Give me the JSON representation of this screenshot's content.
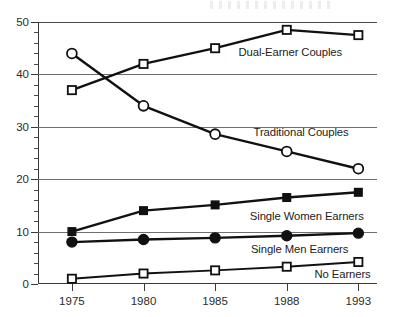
{
  "chart_data": {
    "type": "line",
    "title": "",
    "subtitle": "",
    "xlabel": "",
    "ylabel": "",
    "categories": [
      "1975",
      "1980",
      "1985",
      "1988",
      "1993"
    ],
    "ylim": [
      0,
      50
    ],
    "yticks_major": [
      0,
      10,
      20,
      30,
      40,
      50
    ],
    "ytick_labels": [
      "0",
      "10",
      "20",
      "30",
      "40",
      "50"
    ],
    "ytick_minor_step": 2,
    "grid": "horizontal-major",
    "legend_position": "inline-annotations",
    "series": [
      {
        "name": "Dual-Earner Couples",
        "marker": "open-square",
        "values": [
          37,
          42,
          45,
          48.5,
          47.5
        ],
        "label": "Dual-Earner Couples"
      },
      {
        "name": "Traditional Couples",
        "marker": "open-circle",
        "values": [
          44,
          34,
          28.6,
          25.3,
          22
        ],
        "label": "Traditional Couples"
      },
      {
        "name": "Single Women Earners",
        "marker": "filled-square",
        "values": [
          10,
          14,
          15.1,
          16.5,
          17.5
        ],
        "label": "Single Women Earners"
      },
      {
        "name": "Single Men Earners",
        "marker": "filled-circle",
        "values": [
          8,
          8.5,
          8.8,
          9.2,
          9.7
        ],
        "label": "Single Men Earners"
      },
      {
        "name": "No Earners",
        "marker": "open-square",
        "values": [
          1,
          2,
          2.6,
          3.3,
          4.2
        ],
        "label": "No Earners"
      }
    ],
    "annotations": [
      {
        "text": "Dual-Earner Couples",
        "x_category": 3.05,
        "y_value": 44.2
      },
      {
        "text": "Traditional Couples",
        "x_category": 3.2,
        "y_value": 29.0
      },
      {
        "text": "Single Women Earners",
        "x_category": 3.28,
        "y_value": 13.0
      },
      {
        "text": "Single Men Earners",
        "x_category": 3.18,
        "y_value": 6.6
      },
      {
        "text": "No Earners",
        "x_category": 3.78,
        "y_value": 2.0
      }
    ],
    "colors": {
      "series_stroke": "#111111",
      "marker_fill_open": "#ffffff",
      "marker_fill_solid": "#111111",
      "gridline": "#6e6e6e",
      "axis": "#3a3a3a",
      "background": "#ffffff",
      "text": "#2b2b2b"
    }
  }
}
